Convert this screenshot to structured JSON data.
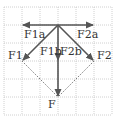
{
  "diagram": {
    "type": "force-vector-decomposition",
    "grid": {
      "cell_px": 18,
      "x_lines": [
        4,
        22,
        40,
        58,
        76,
        94,
        112
      ],
      "y_lines": [
        7,
        25,
        43,
        61,
        79,
        97,
        115
      ],
      "color": "#bdbdbd"
    },
    "colors": {
      "vector": "#555555",
      "dotted": "#777777",
      "label": "#333333"
    },
    "origin": {
      "x": 58,
      "y": 25
    },
    "vectors": [
      {
        "name": "F1a",
        "from": [
          58,
          25
        ],
        "to": [
          22,
          25
        ]
      },
      {
        "name": "F2a",
        "from": [
          58,
          25
        ],
        "to": [
          94,
          25
        ]
      },
      {
        "name": "F1",
        "from": [
          58,
          25
        ],
        "to": [
          22,
          61
        ]
      },
      {
        "name": "F2",
        "from": [
          58,
          25
        ],
        "to": [
          94,
          61
        ]
      },
      {
        "name": "F1b/F2b",
        "from": [
          58,
          25
        ],
        "to": [
          58,
          61
        ]
      },
      {
        "name": "F",
        "from": [
          58,
          61
        ],
        "to": [
          58,
          97
        ]
      }
    ],
    "dotted_lines": [
      {
        "from": [
          22,
          61
        ],
        "to": [
          58,
          97
        ]
      },
      {
        "from": [
          94,
          61
        ],
        "to": [
          58,
          97
        ]
      }
    ],
    "labels": {
      "f1a": "F1a",
      "f2a": "F2a",
      "f1": "F1",
      "f2": "F2",
      "f1b": "F1b",
      "f2b": "F2b",
      "f": "F"
    }
  }
}
